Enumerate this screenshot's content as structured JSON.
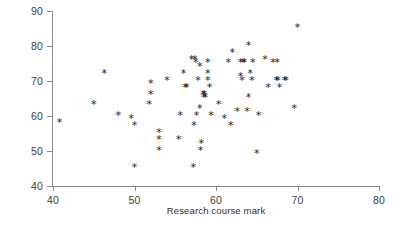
{
  "chart_data": {
    "type": "scatter",
    "title": "",
    "xlabel": "Research course mark",
    "ylabel": "Dissertation mark",
    "xlim": [
      40,
      80
    ],
    "ylim": [
      40,
      90
    ],
    "xticks": [
      40,
      50,
      60,
      70,
      80
    ],
    "yticks": [
      40,
      50,
      60,
      70,
      80,
      90
    ],
    "grid": false,
    "legend": null,
    "marker": "*",
    "marker_color": "#1c1c1c",
    "axis_color": "#8a8a8a",
    "points": [
      [
        40.8,
        58
      ],
      [
        45.0,
        63
      ],
      [
        46.3,
        72
      ],
      [
        48.0,
        60
      ],
      [
        49.6,
        59
      ],
      [
        50.0,
        45
      ],
      [
        50.0,
        57
      ],
      [
        51.8,
        63
      ],
      [
        52.0,
        69
      ],
      [
        52.0,
        66
      ],
      [
        53.0,
        55
      ],
      [
        53.0,
        53
      ],
      [
        53.0,
        50
      ],
      [
        54.0,
        70
      ],
      [
        55.4,
        53
      ],
      [
        55.6,
        60
      ],
      [
        56.0,
        72
      ],
      [
        56.2,
        68
      ],
      [
        56.4,
        68
      ],
      [
        57.0,
        76
      ],
      [
        57.2,
        45
      ],
      [
        57.3,
        57
      ],
      [
        57.4,
        76
      ],
      [
        57.5,
        75
      ],
      [
        57.6,
        60
      ],
      [
        57.8,
        70
      ],
      [
        58.0,
        74
      ],
      [
        58.0,
        62
      ],
      [
        58.1,
        50
      ],
      [
        58.2,
        52
      ],
      [
        58.4,
        66
      ],
      [
        58.5,
        65
      ],
      [
        58.6,
        66
      ],
      [
        58.7,
        65
      ],
      [
        59.0,
        75
      ],
      [
        59.0,
        72
      ],
      [
        59.0,
        70
      ],
      [
        59.2,
        68
      ],
      [
        59.4,
        60
      ],
      [
        60.3,
        63
      ],
      [
        61.0,
        59
      ],
      [
        61.5,
        75
      ],
      [
        61.8,
        57
      ],
      [
        62.0,
        78
      ],
      [
        62.6,
        61
      ],
      [
        63.0,
        75
      ],
      [
        63.0,
        71
      ],
      [
        63.2,
        70
      ],
      [
        63.3,
        75
      ],
      [
        63.5,
        75
      ],
      [
        63.8,
        61
      ],
      [
        64.0,
        65
      ],
      [
        64.0,
        80
      ],
      [
        64.2,
        72
      ],
      [
        64.4,
        70
      ],
      [
        64.5,
        75
      ],
      [
        65.0,
        49
      ],
      [
        65.2,
        60
      ],
      [
        66.0,
        76
      ],
      [
        66.4,
        68
      ],
      [
        67.0,
        75
      ],
      [
        67.4,
        70
      ],
      [
        67.5,
        75
      ],
      [
        67.6,
        70
      ],
      [
        67.8,
        68
      ],
      [
        68.4,
        70
      ],
      [
        68.6,
        70
      ],
      [
        69.6,
        62
      ],
      [
        70.0,
        85
      ]
    ]
  },
  "axes": {
    "y_tick_labels": [
      "90",
      "80",
      "70",
      "60",
      "50",
      "40"
    ],
    "x_tick_labels": [
      "40",
      "50",
      "60",
      "70",
      "80"
    ],
    "y_title": "Dissertation mark",
    "x_title": "Research course mark"
  }
}
